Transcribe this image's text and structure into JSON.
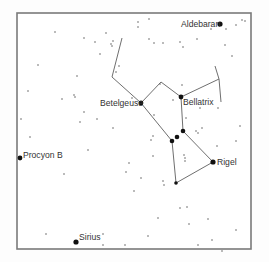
{
  "figure": {
    "width": 269,
    "height": 262,
    "frame": {
      "x": 17,
      "y": 13,
      "w": 234,
      "h": 236,
      "color": "#7a7a7a"
    },
    "colors": {
      "bright_star": "#111111",
      "dim_star": "#555555",
      "line": "#6f6f6f",
      "label": "#333333"
    }
  },
  "labels": {
    "aldebaran": "Aldebaran",
    "betelgeuse": "Betelgeuse",
    "bellatrix": "Bellatrix",
    "rigel": "Rigel",
    "procyon_b": "Procyon B",
    "sirius": "Sirius"
  },
  "named_stars": [
    {
      "id": "aldebaran",
      "x": 220,
      "y": 24,
      "r": 2.6,
      "label_x": 181,
      "label_y": 27
    },
    {
      "id": "betelgeuse",
      "x": 141,
      "y": 103,
      "r": 2.4,
      "label_x": 100,
      "label_y": 106
    },
    {
      "id": "bellatrix",
      "x": 181,
      "y": 97,
      "r": 2.4,
      "label_x": 183,
      "label_y": 105
    },
    {
      "id": "rigel",
      "x": 213,
      "y": 162,
      "r": 2.6,
      "label_x": 217,
      "label_y": 165
    },
    {
      "id": "procyon_b",
      "x": 20,
      "y": 158,
      "r": 2.4,
      "label_x": 23,
      "label_y": 158
    },
    {
      "id": "sirius",
      "x": 76,
      "y": 242,
      "r": 2.6,
      "label_x": 79,
      "label_y": 240
    }
  ],
  "belt_stars": [
    {
      "x": 183,
      "y": 131,
      "r": 2.3
    },
    {
      "x": 177,
      "y": 137,
      "r": 2.3
    },
    {
      "x": 172,
      "y": 141,
      "r": 2.3
    }
  ],
  "saiph": {
    "x": 176,
    "y": 183,
    "r": 1.8
  },
  "constellation_lines": [
    [
      [
        122,
        38
      ],
      [
        112,
        77
      ],
      [
        141,
        103
      ]
    ],
    [
      [
        141,
        103
      ],
      [
        161,
        82
      ],
      [
        181,
        97
      ],
      [
        219,
        79
      ]
    ],
    [
      [
        215,
        66
      ],
      [
        219,
        79
      ],
      [
        221,
        102
      ]
    ],
    [
      [
        181,
        97
      ],
      [
        183,
        131
      ],
      [
        213,
        162
      ]
    ],
    [
      [
        141,
        103
      ],
      [
        172,
        141
      ],
      [
        176,
        183
      ],
      [
        213,
        162
      ]
    ]
  ],
  "dim_stars": [
    [
      55,
      32
    ],
    [
      84,
      38
    ],
    [
      95,
      42
    ],
    [
      106,
      33
    ],
    [
      111,
      44
    ],
    [
      112,
      46
    ],
    [
      100,
      54
    ],
    [
      38,
      65
    ],
    [
      77,
      76
    ],
    [
      28,
      91
    ],
    [
      62,
      99
    ],
    [
      74,
      95
    ],
    [
      75,
      97
    ],
    [
      84,
      112
    ],
    [
      80,
      122
    ],
    [
      97,
      119
    ],
    [
      113,
      128
    ],
    [
      21,
      119
    ],
    [
      113,
      41
    ],
    [
      116,
      72
    ],
    [
      119,
      66
    ],
    [
      132,
      98
    ],
    [
      138,
      22
    ],
    [
      149,
      19
    ],
    [
      138,
      27
    ],
    [
      149,
      39
    ],
    [
      154,
      43
    ],
    [
      163,
      43
    ],
    [
      180,
      42
    ],
    [
      183,
      47
    ],
    [
      197,
      39
    ],
    [
      211,
      29
    ],
    [
      226,
      29
    ],
    [
      236,
      25
    ],
    [
      242,
      20
    ],
    [
      245,
      21
    ],
    [
      225,
      45
    ],
    [
      232,
      56
    ],
    [
      182,
      85
    ],
    [
      173,
      100
    ],
    [
      160,
      84
    ],
    [
      154,
      115
    ],
    [
      200,
      108
    ],
    [
      218,
      108
    ],
    [
      186,
      118
    ],
    [
      196,
      131
    ],
    [
      198,
      133
    ],
    [
      240,
      126
    ],
    [
      217,
      146
    ],
    [
      236,
      141
    ],
    [
      202,
      128
    ],
    [
      153,
      136
    ],
    [
      151,
      140
    ],
    [
      184,
      155
    ],
    [
      185,
      158
    ],
    [
      185,
      161
    ],
    [
      153,
      156
    ],
    [
      141,
      178
    ],
    [
      163,
      181
    ],
    [
      164,
      185
    ],
    [
      180,
      208
    ],
    [
      187,
      207
    ],
    [
      208,
      219
    ],
    [
      198,
      245
    ],
    [
      222,
      251
    ],
    [
      236,
      230
    ],
    [
      212,
      240
    ],
    [
      148,
      236
    ],
    [
      189,
      224
    ],
    [
      88,
      150
    ],
    [
      30,
      137
    ],
    [
      129,
      163
    ],
    [
      134,
      191
    ],
    [
      158,
      218
    ],
    [
      64,
      174
    ],
    [
      46,
      234
    ],
    [
      126,
      172
    ],
    [
      103,
      245
    ],
    [
      125,
      245
    ],
    [
      103,
      234
    ]
  ]
}
